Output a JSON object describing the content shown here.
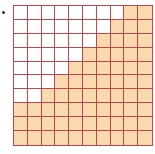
{
  "diagram": {
    "type": "hundred-grid",
    "rows": 10,
    "cols": 10,
    "shaded_per_row_from_right": [
      2,
      3,
      4,
      5,
      6,
      7,
      8,
      10,
      10,
      10
    ],
    "shaded_total": 65,
    "colors": {
      "grid_line": "#c0474b",
      "shaded_fill": "#fbd9ae",
      "empty_fill": "#ffffff"
    }
  }
}
